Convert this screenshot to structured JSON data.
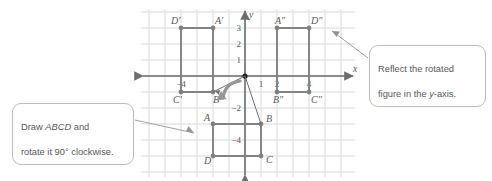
{
  "diagram": {
    "type": "coordinate-plane",
    "axes": {
      "x_label": "x",
      "y_label": "y",
      "x_ticks": [
        {
          "value": -4,
          "label": "−4"
        },
        {
          "value": 1,
          "label": "1"
        },
        {
          "value": 2,
          "label": "2"
        },
        {
          "value": 4,
          "label": "4"
        }
      ],
      "y_ticks": [
        {
          "value": 3,
          "label": "3"
        },
        {
          "value": 2,
          "label": "2"
        },
        {
          "value": 1,
          "label": "1"
        },
        {
          "value": -2,
          "label": "−2"
        },
        {
          "value": -4,
          "label": "−4"
        }
      ],
      "x_range": [
        -7,
        7
      ],
      "y_range": [
        -6,
        4
      ],
      "grid": true,
      "grid_color": "#d9d9dc",
      "axis_color": "#6d6e71"
    },
    "figures": [
      {
        "name": "ABCD",
        "color": "#808285",
        "vertices": [
          {
            "label": "A",
            "x": -2,
            "y": -3,
            "label_dx": -9,
            "label_dy": -3
          },
          {
            "label": "B",
            "x": 1,
            "y": -3,
            "label_dx": 5,
            "label_dy": -2
          },
          {
            "label": "C",
            "x": 1,
            "y": -5,
            "label_dx": 5,
            "label_dy": 7
          },
          {
            "label": "D",
            "x": -2,
            "y": -5,
            "label_dx": -9,
            "label_dy": 8
          }
        ]
      },
      {
        "name": "A'B'C'D'",
        "color": "#808285",
        "vertices": [
          {
            "label": "A′",
            "x": -2,
            "y": 3,
            "label_dx": 2,
            "label_dy": -4
          },
          {
            "label": "B′",
            "x": -2,
            "y": -1,
            "label_dx": 0,
            "label_dy": 11
          },
          {
            "label": "C′",
            "x": -4,
            "y": -1,
            "label_dx": -8,
            "label_dy": 11
          },
          {
            "label": "D′",
            "x": -4,
            "y": 3,
            "label_dx": -10,
            "label_dy": -4
          }
        ]
      },
      {
        "name": "A″B″C″D″",
        "color": "#808285",
        "vertices": [
          {
            "label": "A″",
            "x": 2,
            "y": 3,
            "label_dx": -2,
            "label_dy": -4
          },
          {
            "label": "B″",
            "x": 2,
            "y": -1,
            "label_dx": -4,
            "label_dy": 11
          },
          {
            "label": "C″",
            "x": 4,
            "y": -1,
            "label_dx": 2,
            "label_dy": 11
          },
          {
            "label": "D″",
            "x": 4,
            "y": 3,
            "label_dx": 2,
            "label_dy": -4
          }
        ]
      }
    ],
    "rotation_arc": {
      "note": "curved arrow at origin indicating 90° clockwise rotation"
    },
    "connector_lines": [
      {
        "from": {
          "x": 0,
          "y": 0
        },
        "to": {
          "x": -2,
          "y": -1
        }
      },
      {
        "from": {
          "x": 0,
          "y": 0
        },
        "to": {
          "x": 1,
          "y": -3
        }
      }
    ]
  },
  "callouts": {
    "left": {
      "line1_prefix": "Draw ",
      "line1_italic": "ABCD",
      "line1_suffix": " and",
      "line2": "rotate it 90° clockwise.",
      "text": "Draw ABCD and rotate it 90° clockwise."
    },
    "right": {
      "line1": "Reflect the rotated",
      "line2_prefix": "figure in the ",
      "line2_italic": "y",
      "line2_suffix": "-axis.",
      "text": "Reflect the rotated figure in the y-axis."
    }
  },
  "colors": {
    "figure": "#808285",
    "axis": "#6d6e71",
    "grid": "#d9d9dc",
    "callout_border": "#b9bcc0",
    "callout_text": "#58595b",
    "label_text": "#58595b"
  }
}
